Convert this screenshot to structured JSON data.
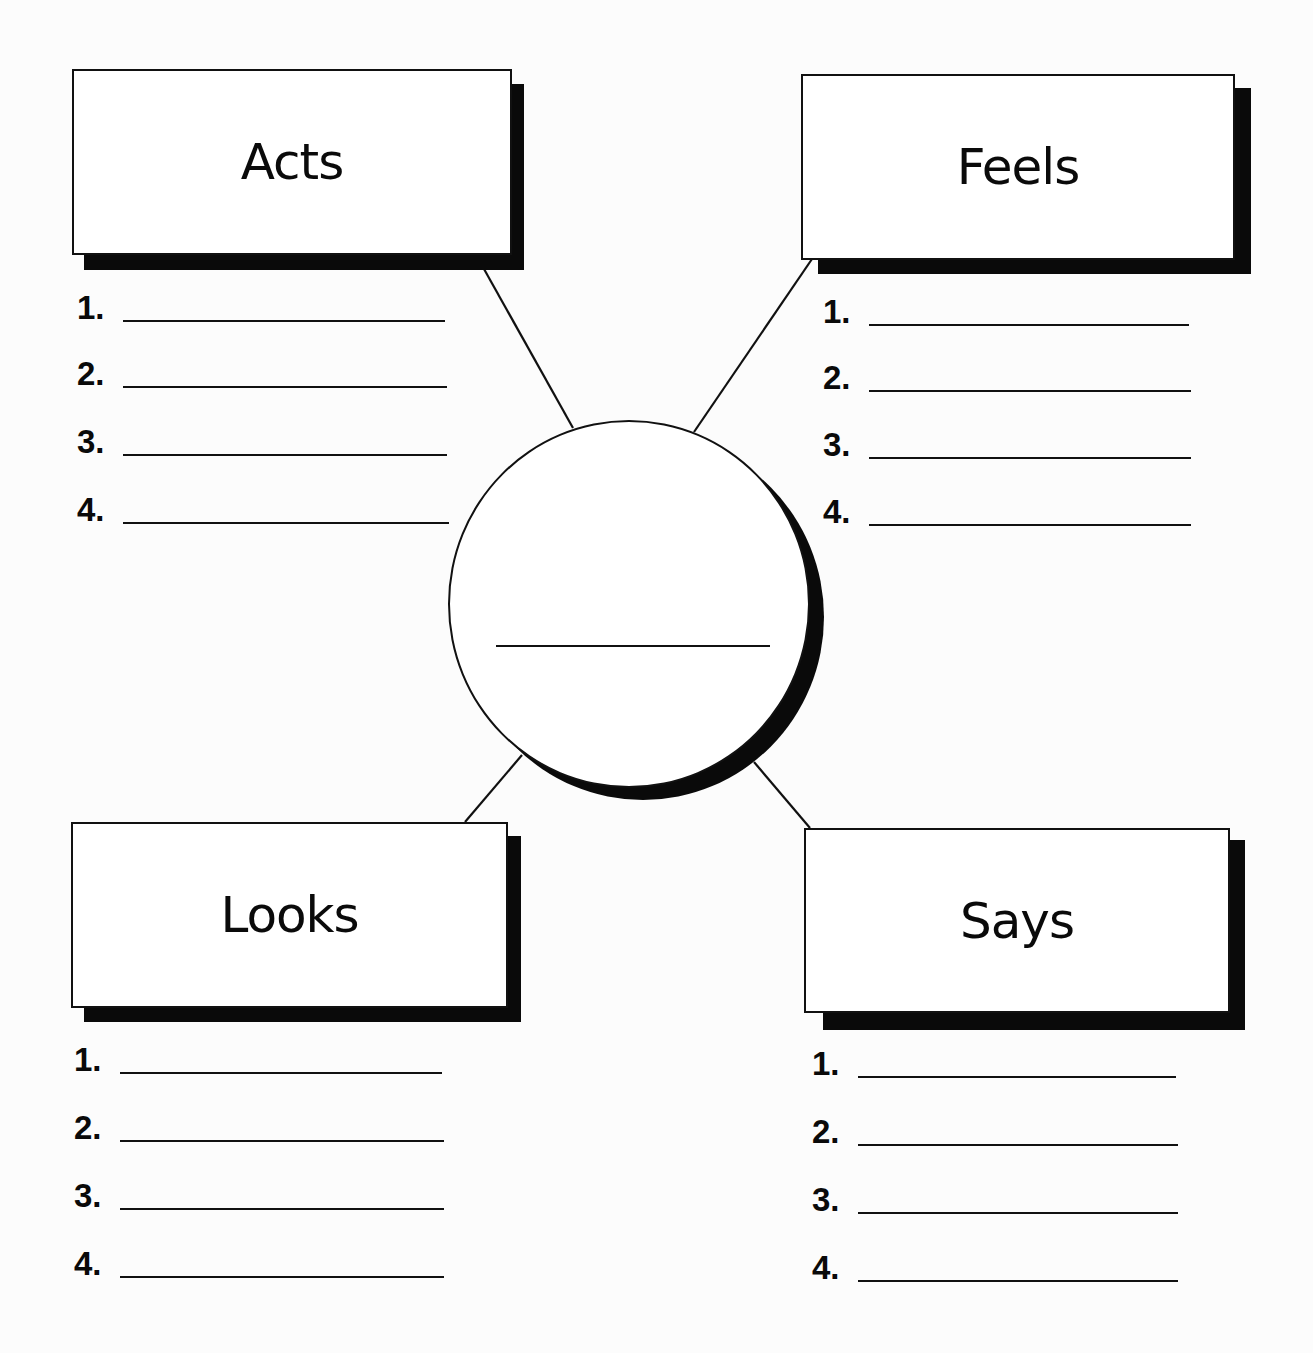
{
  "diagram": {
    "type": "character-trait-web",
    "center": {
      "label": "",
      "blank_line": true
    },
    "boxes": [
      {
        "id": "acts",
        "title": "Acts",
        "position": "top-left",
        "items": [
          {
            "number": "1.",
            "value": ""
          },
          {
            "number": "2.",
            "value": ""
          },
          {
            "number": "3.",
            "value": ""
          },
          {
            "number": "4.",
            "value": ""
          }
        ]
      },
      {
        "id": "feels",
        "title": "Feels",
        "position": "top-right",
        "items": [
          {
            "number": "1.",
            "value": ""
          },
          {
            "number": "2.",
            "value": ""
          },
          {
            "number": "3.",
            "value": ""
          },
          {
            "number": "4.",
            "value": ""
          }
        ]
      },
      {
        "id": "looks",
        "title": "Looks",
        "position": "bottom-left",
        "items": [
          {
            "number": "1.",
            "value": ""
          },
          {
            "number": "2.",
            "value": ""
          },
          {
            "number": "3.",
            "value": ""
          },
          {
            "number": "4.",
            "value": ""
          }
        ]
      },
      {
        "id": "says",
        "title": "Says",
        "position": "bottom-right",
        "items": [
          {
            "number": "1.",
            "value": ""
          },
          {
            "number": "2.",
            "value": ""
          },
          {
            "number": "3.",
            "value": ""
          },
          {
            "number": "4.",
            "value": ""
          }
        ]
      }
    ],
    "colors": {
      "ink": "#111111",
      "shadow": "#0a0a0a",
      "paper": "#fcfcfc",
      "box_fill": "#ffffff"
    }
  }
}
